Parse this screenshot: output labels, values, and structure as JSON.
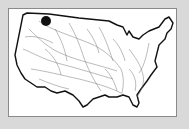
{
  "map": {
    "subject": "Contiguous United States river network",
    "background_color": "#d9d9d9",
    "frame_color": "#ffffff",
    "marker": {
      "label": "location-marker",
      "color": "#111111",
      "approx_region": "northern Rockies (Montana/Idaho)"
    }
  }
}
